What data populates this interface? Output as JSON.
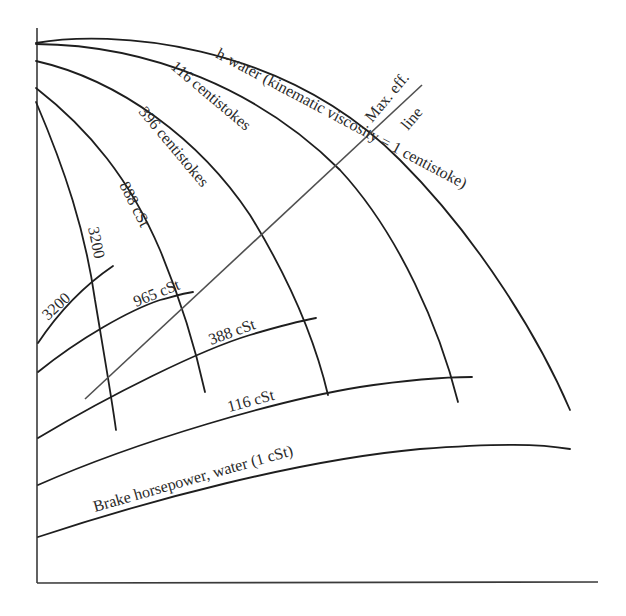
{
  "diagram": {
    "type": "pump performance characteristic curves (effect of viscosity)",
    "colors": {
      "background": "#ffffff",
      "lines": "#1e1e1e",
      "max_eff_line": "#505050",
      "text": "#2a2a2a"
    },
    "head_curves": [
      {
        "id": "h-water",
        "label": "h-water (kinematic viscosity = 1 centistoke)"
      },
      {
        "id": "h-116",
        "label": "116 centistokes"
      },
      {
        "id": "h-396",
        "label": "396 centistokes"
      },
      {
        "id": "h-888",
        "label": "888 cSt"
      },
      {
        "id": "h-3200",
        "label": "3200"
      }
    ],
    "power_curves": [
      {
        "id": "bhp-water",
        "label": "Brake horsepower, water (1 cSt)"
      },
      {
        "id": "bhp-116",
        "label": "116 cSt"
      },
      {
        "id": "bhp-388",
        "label": "388 cSt"
      },
      {
        "id": "bhp-965",
        "label": "965 cSt"
      },
      {
        "id": "bhp-3200",
        "label": "3200"
      }
    ],
    "max_eff_line": {
      "label_line1": "Max. eff.",
      "label_line2": "line"
    }
  }
}
